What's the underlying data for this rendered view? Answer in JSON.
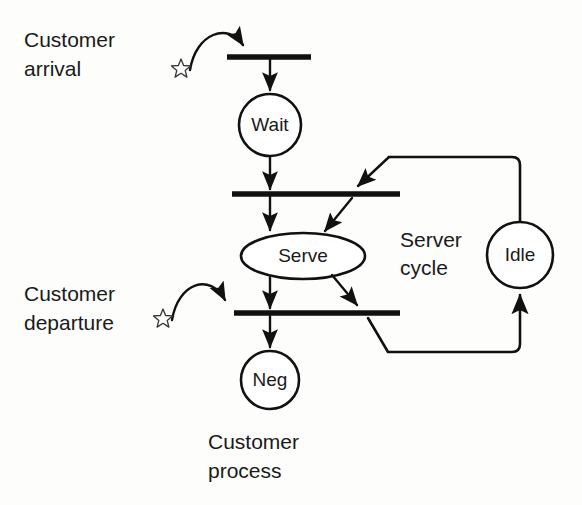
{
  "diagram": {
    "background_color": "#fdfdfc",
    "line_color": "#111111",
    "text_color": "#1a1a1a"
  },
  "places": [
    {
      "id": "wait",
      "label": "Wait",
      "shape": "circle",
      "cx": 270,
      "cy": 125,
      "r": 31
    },
    {
      "id": "serve",
      "label": "Serve",
      "shape": "ellipse",
      "cx": 303,
      "cy": 256,
      "rx": 62,
      "ry": 23
    },
    {
      "id": "neg",
      "label": "Neg",
      "shape": "circle",
      "cx": 270,
      "cy": 380,
      "r": 29
    },
    {
      "id": "idle",
      "label": "Idle",
      "shape": "circle",
      "cx": 520,
      "cy": 255,
      "r": 33
    }
  ],
  "transitions": [
    {
      "id": "t-arrival",
      "x1": 227,
      "y1": 57,
      "x2": 311,
      "y2": 57
    },
    {
      "id": "t-start",
      "x1": 232,
      "y1": 194,
      "x2": 400,
      "y2": 194
    },
    {
      "id": "t-departure",
      "x1": 234,
      "y1": 313,
      "x2": 400,
      "y2": 313
    }
  ],
  "tokens": [
    {
      "id": "token-arrival",
      "cx": 181,
      "cy": 68,
      "r": 9
    },
    {
      "id": "token-departure",
      "cx": 163,
      "cy": 318,
      "r": 9
    }
  ],
  "labels": {
    "customer_arrival_line1": "Customer",
    "customer_arrival_line2": "arrival",
    "customer_departure_line1": "Customer",
    "customer_departure_line2": "departure",
    "server_cycle_line1": "Server",
    "server_cycle_line2": "cycle",
    "customer_process_line1": "Customer",
    "customer_process_line2": "process"
  },
  "annotations": {
    "server_cycle": "Server cycle",
    "customer_process": "Customer process",
    "customer_arrival": "Customer arrival",
    "customer_departure": "Customer departure"
  }
}
